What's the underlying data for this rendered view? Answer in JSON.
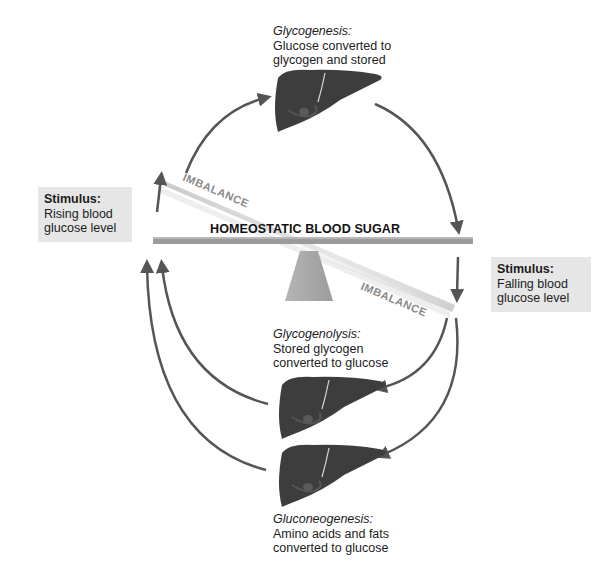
{
  "diagram": {
    "center_label": "HOMEOSTATIC BLOOD SUGAR",
    "imbalance_upper": "IMBALANCE",
    "imbalance_lower": "IMBALANCE",
    "colors": {
      "arrow": "#555555",
      "liver": "#3a3a3a",
      "beam": "#9a9a9a",
      "fulcrum": "#a8a8a8",
      "stimulus_box": "#e6e6e6"
    }
  },
  "stimuli": {
    "left": {
      "heading": "Stimulus:",
      "line1": "Rising blood",
      "line2": "glucose level"
    },
    "right": {
      "heading": "Stimulus:",
      "line1": "Falling blood",
      "line2": "glucose level"
    }
  },
  "processes": {
    "glycogenesis": {
      "title": "Glycogenesis:",
      "line1": "Glucose converted to",
      "line2": "glycogen and stored"
    },
    "glycogenolysis": {
      "title": "Glycogenolysis:",
      "line1": "Stored glycogen",
      "line2": "converted to glucose"
    },
    "gluconeogenesis": {
      "title": "Gluconeogenesis:",
      "line1": "Amino acids and fats",
      "line2": "converted to glucose"
    }
  }
}
